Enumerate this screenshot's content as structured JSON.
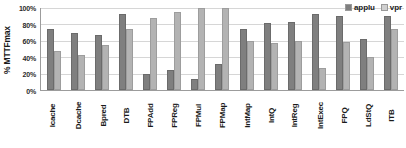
{
  "chart_data": {
    "type": "bar",
    "title": "",
    "xlabel": "",
    "ylabel": "% MTTFmax",
    "ylim": [
      0,
      100
    ],
    "ytick_labels": [
      "100%",
      "80%",
      "60%",
      "40%",
      "20%",
      "0%"
    ],
    "ytick_values": [
      100,
      80,
      60,
      40,
      20,
      0
    ],
    "grid": true,
    "legend_position": "top-right",
    "categories": [
      "Icache",
      "Dcache",
      "Bpred",
      "DTB",
      "FPAdd",
      "FPReg",
      "FPMul",
      "FPMap",
      "IntMap",
      "IntQ",
      "IntReg",
      "IntExec",
      "FPQ",
      "LdStQ",
      "ITB"
    ],
    "series": [
      {
        "name": "applu",
        "color": "#7f7f7f",
        "values": [
          75,
          70,
          67,
          93,
          20,
          25,
          13,
          32,
          75,
          82,
          83,
          93,
          90,
          62,
          90
        ]
      },
      {
        "name": "vpr",
        "color": "#b3b3b3",
        "values": [
          47,
          43,
          55,
          75,
          88,
          95,
          100,
          100,
          60,
          57,
          60,
          27,
          58,
          40,
          75
        ]
      }
    ]
  },
  "legend": {
    "entries": [
      {
        "label": "applu"
      },
      {
        "label": "vpr"
      }
    ]
  }
}
